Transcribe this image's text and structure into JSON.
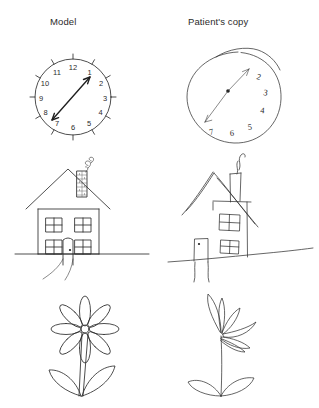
{
  "figure": {
    "background_color": "#ffffff",
    "ink_color": "#2e2e2e",
    "columns": [
      {
        "id": "model",
        "heading": "Model"
      },
      {
        "id": "patient",
        "heading": "Patient's copy"
      }
    ],
    "rows": [
      {
        "id": "clock",
        "subject": "clock face"
      },
      {
        "id": "house",
        "subject": "house"
      },
      {
        "id": "flower",
        "subject": "flower"
      }
    ]
  },
  "headings": {
    "model": "Model",
    "patient": "Patient's copy"
  },
  "clock_model": {
    "numerals": [
      "12",
      "1",
      "2",
      "3",
      "4",
      "5",
      "6",
      "7",
      "8",
      "9",
      "10",
      "11"
    ],
    "tick_count": 12,
    "hands": "double-headed arrow from 7-8 o'clock to 1 o'clock",
    "outline": "complete circle"
  },
  "clock_patient": {
    "numerals": [
      "2",
      "3",
      "4",
      "5",
      "6",
      "7"
    ],
    "missing_numerals": [
      "8",
      "9",
      "10",
      "11",
      "12",
      "1"
    ],
    "tick_count": 0,
    "hands": "double-headed arrow from 7 o'clock to 1 o'clock",
    "outline": "irregular circle with overshooting double line at top"
  },
  "house_model": {
    "parts": [
      "roof",
      "chimney",
      "smoke",
      "window-top-left",
      "window-top-right",
      "window-bottom-left",
      "window-bottom-right",
      "door",
      "doorknob",
      "path",
      "ground-line"
    ],
    "window_count": 4,
    "ground_line": "straight horizontal"
  },
  "house_patient": {
    "parts": [
      "roof",
      "chimney",
      "smoke",
      "window-top-right",
      "window-bottom-right",
      "door",
      "doorknob",
      "path",
      "ground-line"
    ],
    "window_count": 2,
    "missing_parts": [
      "left wall",
      "window-top-left",
      "window-bottom-left"
    ],
    "ground_line": "slanted wavering"
  },
  "flower_model": {
    "petal_count": 8,
    "leaf_count": 2,
    "stem": "double-line straight stem",
    "center": "small round center"
  },
  "flower_patient": {
    "petal_count": 5,
    "leaf_count": 2,
    "stem": "single wavering line",
    "center": "petals clustered to the right side"
  }
}
